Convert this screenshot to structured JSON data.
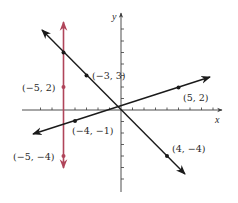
{
  "figure": {
    "axes": {
      "x_label": "x",
      "y_label": "y",
      "x_ticks": [
        -7,
        -6,
        -5,
        -4,
        -3,
        -2,
        -1,
        1,
        2,
        3,
        4,
        5,
        6,
        7,
        8
      ],
      "y_ticks": [
        -7,
        -6,
        -5,
        -4,
        -3,
        -2,
        -1,
        1,
        2,
        3,
        4,
        5,
        6,
        7,
        8
      ]
    },
    "colors": {
      "axis": "#3a3a3a",
      "line_black": "#1a1a1a",
      "line_red": "#b0455a",
      "text": "#2a2a2a"
    },
    "lines": [
      {
        "name": "vertical-line-x-neg5",
        "color": "red",
        "equation": "x = -5",
        "points": [
          "(-5, 2)",
          "(-5, -4)"
        ]
      },
      {
        "name": "line-through-neg3-3-and-4-neg4",
        "color": "black",
        "equation": "y = -x",
        "points": [
          "(-3, 3)",
          "(4, -4)"
        ]
      },
      {
        "name": "line-through-neg4-neg1-and-5-2",
        "color": "black",
        "equation": "y = x/3 + 1/3",
        "points": [
          "(-4, -1)",
          "(5, 2)"
        ]
      }
    ],
    "point_labels": {
      "p1": "(−3, 3)",
      "p2": "(5, 2)",
      "p3": "(−5, 2)",
      "p4": "(−4, −1)",
      "p5": "(−5, −4)",
      "p6": "(4, −4)"
    }
  }
}
